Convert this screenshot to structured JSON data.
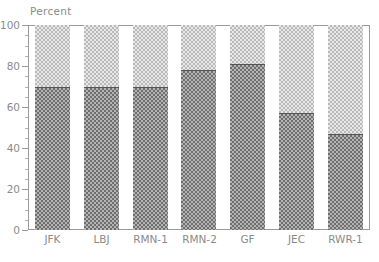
{
  "chart_data": {
    "type": "bar",
    "stacked": true,
    "title": "",
    "subtitle": "",
    "xlabel": "",
    "ylabel": "Percent",
    "ylim": [
      0,
      100
    ],
    "grid": false,
    "legend": "none",
    "y_ticks_major": [
      0,
      20,
      40,
      60,
      80,
      100
    ],
    "y_tick_labels": [
      "0",
      "20",
      "40",
      "60",
      "80",
      "100"
    ],
    "y_tick_minor_step": 5,
    "categories": [
      "JFK",
      "LBJ",
      "RMN-1",
      "RMN-2",
      "GF",
      "JEC",
      "RWR-1"
    ],
    "series": [
      {
        "name": "lower-segment",
        "pattern": "dark-checkerboard",
        "color": "#6e6e6e",
        "values": [
          70,
          70,
          70,
          78,
          81,
          57,
          47
        ]
      },
      {
        "name": "upper-segment",
        "pattern": "light-checkerboard",
        "color": "#b9b9b9",
        "values": [
          30,
          30,
          30,
          22,
          19,
          43,
          53
        ]
      }
    ],
    "annotations": []
  },
  "axes": {
    "y_axis_title": "Percent",
    "frame_color": "#9a9a9a",
    "tick_color": "#9a9a9a",
    "text_color": "#8a8a8a"
  }
}
